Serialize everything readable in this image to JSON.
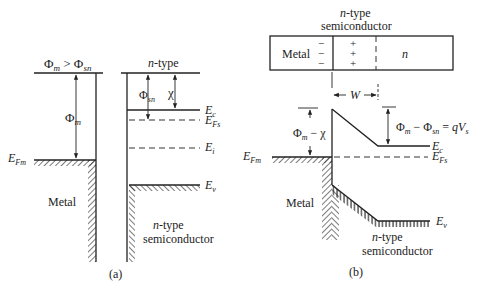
{
  "figure": {
    "panel_a": {
      "caption": "(a)",
      "condition": {
        "lhs": "Φ",
        "lhs_sub": "m",
        "op": " > ",
        "rhs": "Φ",
        "rhs_sub": "sn"
      },
      "metal": {
        "label": "Metal",
        "work_function": {
          "sym": "Φ",
          "sub": "m"
        },
        "fermi_level": {
          "sym": "E",
          "sub": "Fm"
        }
      },
      "semiconductor": {
        "top_label": "n-type",
        "top_label_n": "n",
        "top_label_rest": "-type",
        "bottom_label_line1_n": "n",
        "bottom_label_line1_rest": "-type",
        "bottom_label_line2": "semiconductor",
        "work_function": {
          "sym": "Φ",
          "sub": "sn"
        },
        "electron_affinity": {
          "sym": "χ"
        },
        "levels": [
          {
            "sym": "E",
            "sub": "c",
            "style": "solid"
          },
          {
            "sym": "E",
            "sub": "Fs",
            "style": "dashed"
          },
          {
            "sym": "E",
            "sub": "i",
            "style": "dashed"
          },
          {
            "sym": "E",
            "sub": "v",
            "style": "solid"
          }
        ]
      }
    },
    "panel_b": {
      "caption": "(b)",
      "structure": {
        "title_line1_n": "n",
        "title_line1_rest": "-type",
        "title_line2": "semiconductor",
        "metal_label": "Metal",
        "neutral_label": "n",
        "metal_charges": [
          "−",
          "−",
          "−"
        ],
        "depletion_charges": [
          "+",
          "+",
          "+"
        ]
      },
      "depletion_width": {
        "sym": "W"
      },
      "barrier": {
        "sym": "Φ",
        "sub": "m",
        "minus": " − ",
        "chi": "χ"
      },
      "band_bending": {
        "a": "Φ",
        "a_sub": "m",
        "minus": " − ",
        "b": "Φ",
        "b_sub": "sn",
        "eq": " = ",
        "q": "qV",
        "q_sub": "s"
      },
      "metal": {
        "label": "Metal",
        "fermi_level": {
          "sym": "E",
          "sub": "Fm"
        }
      },
      "semiconductor": {
        "label_line1_n": "n",
        "label_line1_rest": "-type",
        "label_line2": "semiconductor",
        "levels": [
          {
            "sym": "E",
            "sub": "c"
          },
          {
            "sym": "E",
            "sub": "Fs"
          },
          {
            "sym": "E",
            "sub": "v"
          }
        ]
      }
    }
  }
}
